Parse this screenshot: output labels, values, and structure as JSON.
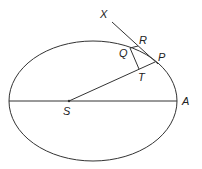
{
  "diagram": {
    "type": "geometry",
    "colors": {
      "stroke": "#333333",
      "text": "#222222",
      "background": "#ffffff"
    },
    "ellipse": {
      "cx": 93,
      "cy": 101,
      "rx": 84,
      "ry": 60
    },
    "points": {
      "S": {
        "label": "S",
        "x": 69,
        "y": 101
      },
      "A": {
        "label": "A",
        "x": 177,
        "y": 101
      },
      "P": {
        "label": "P",
        "x": 155,
        "y": 62
      },
      "X": {
        "label": "X",
        "x": 112,
        "y": 22
      },
      "R": {
        "label": "R",
        "x": 138,
        "y": 46
      },
      "Q": {
        "label": "Q",
        "x": 130,
        "y": 48
      },
      "T": {
        "label": "T",
        "x": 139,
        "y": 69
      }
    },
    "segments": [
      {
        "name": "major-axis",
        "from": "left-vertex",
        "to": "A"
      },
      {
        "name": "SP",
        "from": "S",
        "to": "P"
      },
      {
        "name": "tangent-XP",
        "from": "X",
        "to": "P"
      },
      {
        "name": "QR",
        "from": "Q",
        "to": "R"
      },
      {
        "name": "QT",
        "from": "Q",
        "to": "T"
      }
    ]
  }
}
